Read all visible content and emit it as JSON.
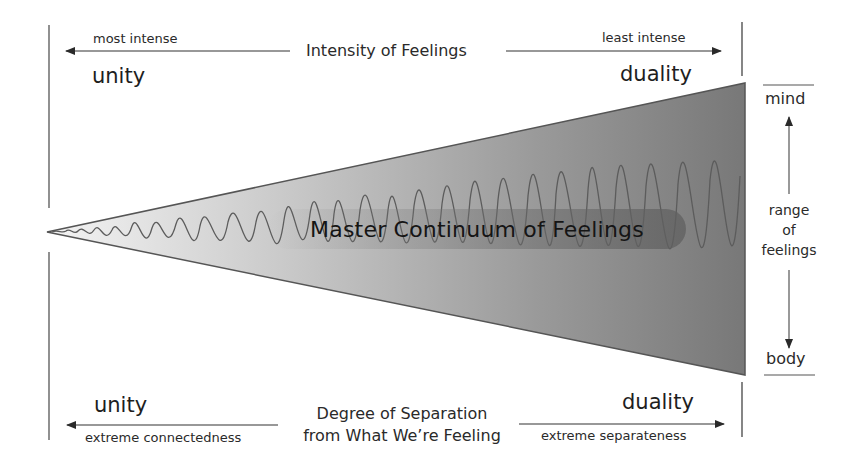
{
  "diagram": {
    "title": "Master Continuum of Feelings",
    "top_axis": {
      "label": "Intensity of Feelings",
      "left_end": "most intense",
      "right_end": "least intense",
      "left_pole": "unity",
      "right_pole": "duality"
    },
    "bottom_axis": {
      "label_line1": "Degree of Separation",
      "label_line2": "from What We’re Feeling",
      "left_end": "extreme connectedness",
      "right_end": "extreme separateness",
      "left_pole": "unity",
      "right_pole": "duality"
    },
    "vertical_axis": {
      "top": "mind",
      "bottom": "body",
      "label_line1": "range",
      "label_line2": "of",
      "label_line3": "feelings"
    },
    "colors": {
      "wedge_light": "#f2f2f2",
      "wedge_dark": "#7a7a7a",
      "wave_stroke": "#5a5a5a",
      "line": "#333333"
    }
  }
}
